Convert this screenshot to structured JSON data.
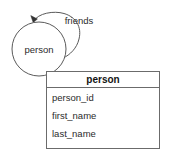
{
  "diagram": {
    "type": "entity-relationship-diagram",
    "background_color": "#ffffff",
    "line_color": "#5a5a5a",
    "text_color": "#2b2b2b",
    "entity": {
      "label": "person",
      "shape": "circle"
    },
    "relationship": {
      "label": "friends",
      "kind": "recursive-self-loop",
      "has_arrowhead": true
    },
    "table": {
      "title": "person",
      "border_color": "#6b6b6b",
      "rows": [
        {
          "name": "person_id"
        },
        {
          "name": "first_name"
        },
        {
          "name": "last_name"
        }
      ]
    }
  }
}
